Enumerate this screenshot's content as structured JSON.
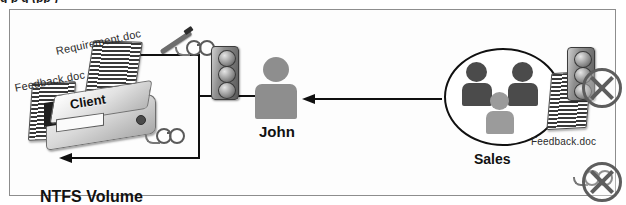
{
  "clipped_caption_above_frame": "g                    p g                (pp )",
  "diagram": {
    "frame": {
      "border_color": "#8d8d8d",
      "background": "#fdfdfd"
    },
    "labels": {
      "requirement_doc": "Requirement.doc",
      "feedback_doc_left": "Feedback.doc",
      "feedback_doc_right": "Feedback.doc",
      "ntfs_volume": "NTFS Volume",
      "client_disk": "Client",
      "john": "John",
      "sales": "Sales"
    },
    "icons": {
      "traffic_light_john": "traffic-light-icon",
      "traffic_light_sales": "traffic-light-icon",
      "pen_glasses_readwrite": "pen-and-glasses-icon",
      "glasses_read": "glasses-icon",
      "glasses_denied": "glasses-icon",
      "prohibited_traffic": "prohibited-circle-x-icon",
      "prohibited_glasses": "prohibited-circle-x-icon",
      "person_john": "person-icon",
      "person_sales_left": "person-icon",
      "person_sales_right": "person-icon",
      "person_sales_middle": "person-icon",
      "disk_drive": "disk-drive-icon",
      "document_stack": "striped-document-stack-icon"
    },
    "connectors": [
      {
        "name": "john-to-requirement-doc",
        "direction": "left",
        "style": "solid-black-arrow"
      },
      {
        "name": "john-to-client-volume",
        "direction": "left",
        "style": "solid-black-arrow"
      },
      {
        "name": "sales-to-john",
        "direction": "left",
        "style": "solid-black-arrow"
      }
    ],
    "colors": {
      "line": "#101010",
      "person_john": "#8e8e8e",
      "person_sales_dark": "#4b4b4b",
      "person_sales_light": "#9b9b9b",
      "prohibit": "#5d5d5d",
      "text": "#242424"
    }
  }
}
